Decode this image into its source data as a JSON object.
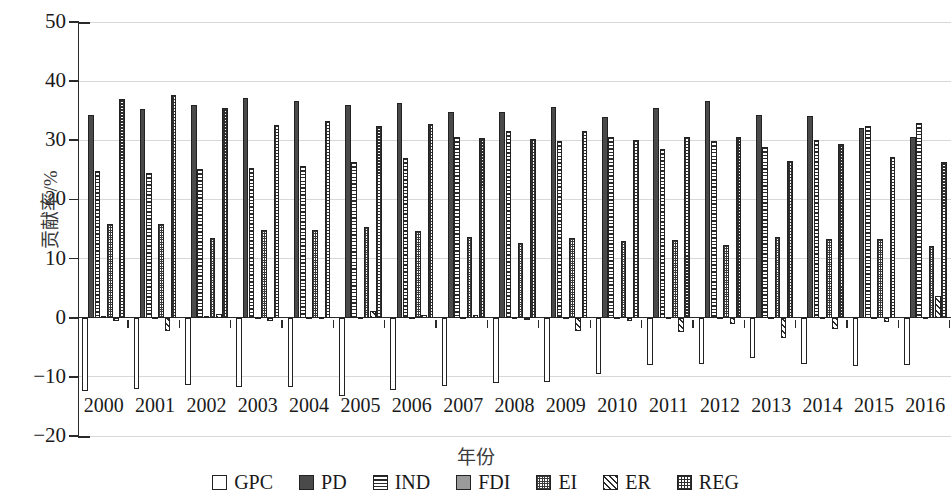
{
  "chart_data": {
    "type": "bar",
    "title": "",
    "xlabel": "年份",
    "ylabel": "贡献率/%",
    "ylim": [
      -20,
      50
    ],
    "yticks": [
      -20,
      -10,
      0,
      10,
      20,
      30,
      40,
      50
    ],
    "ytick_labels": [
      "−20",
      "−10",
      "0",
      "10",
      "20",
      "30",
      "40",
      "50"
    ],
    "grid": true,
    "legend_position": "bottom",
    "categories": [
      "2000",
      "2001",
      "2002",
      "2003",
      "2004",
      "2005",
      "2006",
      "2007",
      "2008",
      "2009",
      "2010",
      "2011",
      "2012",
      "2013",
      "2014",
      "2015",
      "2016"
    ],
    "series": [
      {
        "name": "GPC",
        "pattern": "empty",
        "values": [
          -12.4,
          -12.0,
          -11.4,
          -11.7,
          -11.7,
          -13.3,
          -12.2,
          -11.6,
          -11.1,
          -10.9,
          -9.6,
          -8.0,
          -7.9,
          -6.8,
          -7.9,
          -8.1,
          -8.0
        ]
      },
      {
        "name": "PD",
        "pattern": "solid-dark",
        "values": [
          34.3,
          35.3,
          35.9,
          37.1,
          36.6,
          36.0,
          36.3,
          34.7,
          34.8,
          35.7,
          34.0,
          35.5,
          36.6,
          34.2,
          34.1,
          32.0,
          30.6
        ]
      },
      {
        "name": "IND",
        "pattern": "horizontal-lines",
        "values": [
          24.8,
          24.4,
          25.1,
          25.3,
          25.6,
          26.3,
          27.0,
          30.6,
          31.5,
          29.8,
          30.5,
          28.5,
          29.9,
          28.9,
          30.1,
          32.5,
          32.9
        ]
      },
      {
        "name": "FDI",
        "pattern": "solid-gray",
        "values": [
          0.3,
          0.2,
          0.3,
          0.2,
          0.2,
          0.2,
          0.2,
          0.2,
          0.2,
          0.2,
          0.2,
          0.2,
          0.2,
          0.2,
          0.2,
          0.2,
          0.2
        ]
      },
      {
        "name": "EI",
        "pattern": "fine-checker",
        "values": [
          15.8,
          15.9,
          13.4,
          14.8,
          14.8,
          15.3,
          14.6,
          13.6,
          12.7,
          13.5,
          13.0,
          13.2,
          12.3,
          13.7,
          13.3,
          13.3,
          12.2
        ]
      },
      {
        "name": "ER",
        "pattern": "diagonal-lines",
        "values": [
          -0.5,
          -2.2,
          0.6,
          -0.6,
          0.2,
          1.2,
          0.4,
          0.5,
          -0.4,
          -2.2,
          -0.6,
          -2.4,
          -1.0,
          -3.4,
          -1.9,
          -0.8,
          3.6
        ]
      },
      {
        "name": "REG",
        "pattern": "coarse-checker",
        "values": [
          36.9,
          37.7,
          35.4,
          32.6,
          33.3,
          32.4,
          32.7,
          30.4,
          30.3,
          31.5,
          30.0,
          30.5,
          30.5,
          26.5,
          29.4,
          27.2,
          26.3
        ]
      }
    ]
  },
  "legend": {
    "items": [
      {
        "label": "GPC"
      },
      {
        "label": "PD"
      },
      {
        "label": "IND"
      },
      {
        "label": "FDI"
      },
      {
        "label": "EI"
      },
      {
        "label": "ER"
      },
      {
        "label": "REG"
      }
    ]
  }
}
